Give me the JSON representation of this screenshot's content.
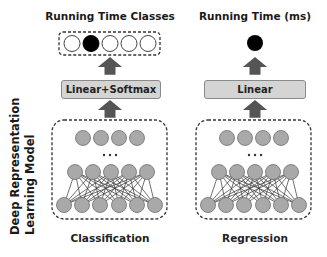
{
  "side_label": {
    "line1": "Deep Representation",
    "line2": "Learning Model"
  },
  "left_panel": {
    "title": "Running Time Classes",
    "layer_label": "Linear+Softmax",
    "caption": "Classification",
    "output_classes": 5,
    "selected_class_index": 1
  },
  "right_panel": {
    "title": "Running Time (ms)",
    "layer_label": "Linear",
    "caption": "Regression",
    "output_nodes": 1
  },
  "network": {
    "top_layer_nodes": 4,
    "middle_layer_nodes": 5,
    "bottom_layer_nodes": 6,
    "ellipsis": "• • •"
  },
  "colors": {
    "node_fill": "#a9a9a9",
    "node_stroke": "#6e6e6e",
    "layer_box_fill": "#d4d4d4",
    "arrow": "#555555",
    "selected_node": "#000000"
  }
}
